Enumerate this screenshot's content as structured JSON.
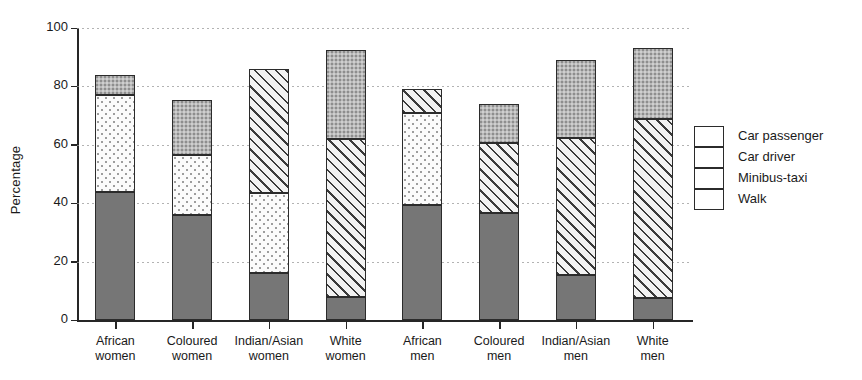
{
  "chart_data": {
    "type": "bar",
    "subtype": "stacked-bar",
    "title": "",
    "xlabel": "",
    "ylabel": "Percentage",
    "ylim": [
      0,
      100
    ],
    "yticks": [
      0,
      20,
      40,
      60,
      80,
      100
    ],
    "grid": true,
    "grid_style": "dotted-horizontal",
    "legend_position": "right",
    "categories": [
      "African women",
      "Coloured women",
      "Indian/Asian women",
      "White women",
      "African men",
      "Coloured men",
      "Indian/Asian men",
      "White men"
    ],
    "category_lines": [
      [
        "African",
        "women"
      ],
      [
        "Coloured",
        "women"
      ],
      [
        "Indian/Asian",
        "women"
      ],
      [
        "White",
        "women"
      ],
      [
        "African",
        "men"
      ],
      [
        "Coloured",
        "men"
      ],
      [
        "Indian/Asian",
        "men"
      ],
      [
        "White",
        "men"
      ]
    ],
    "series": [
      {
        "name": "Walk",
        "pattern": "solid-dark-grey",
        "values": [
          44.0,
          36.0,
          16.0,
          8.0,
          39.5,
          36.5,
          15.5,
          7.5
        ]
      },
      {
        "name": "Minibus-taxi",
        "pattern": "light-dotted",
        "values": [
          33.0,
          20.5,
          27.5,
          0.0,
          31.5,
          0.0,
          0.0,
          0.0
        ]
      },
      {
        "name": "Car driver",
        "pattern": "diagonal-hatch",
        "values": [
          0.0,
          0.0,
          42.5,
          54.0,
          8.0,
          24.0,
          47.0,
          61.5
        ]
      },
      {
        "name": "Car passenger",
        "pattern": "grey-stipple",
        "values": [
          7.0,
          19.0,
          0.0,
          30.5,
          0.0,
          13.5,
          26.5,
          24.0
        ]
      }
    ],
    "totals": [
      84.0,
      75.5,
      86.0,
      92.5,
      79.0,
      74.0,
      89.0,
      93.0
    ],
    "segment_tops": [
      [
        44.0,
        77.0,
        77.0,
        84.0
      ],
      [
        36.0,
        56.5,
        56.5,
        75.5
      ],
      [
        16.0,
        43.5,
        86.0,
        86.0
      ],
      [
        8.0,
        8.0,
        62.0,
        92.5
      ],
      [
        39.5,
        71.0,
        79.0,
        79.0
      ],
      [
        36.5,
        36.5,
        60.5,
        74.0
      ],
      [
        15.5,
        15.5,
        62.5,
        89.0
      ],
      [
        7.5,
        7.5,
        69.0,
        93.0
      ]
    ]
  },
  "legend": {
    "items": [
      {
        "label": "Car passenger"
      },
      {
        "label": "Car driver"
      },
      {
        "label": "Minibus-taxi"
      },
      {
        "label": "Walk"
      }
    ]
  }
}
